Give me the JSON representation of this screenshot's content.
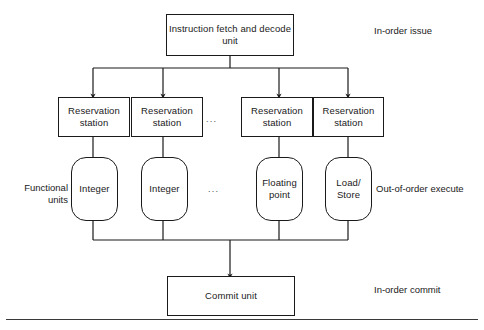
{
  "diagram": {
    "fetch_unit": {
      "label": "Instruction fetch\nand decode unit"
    },
    "commit_unit": {
      "label": "Commit\nunit"
    },
    "reservation_stations": [
      {
        "label": "Reservation\nstation"
      },
      {
        "label": "Reservation\nstation"
      },
      {
        "label": "Reservation\nstation"
      },
      {
        "label": "Reservation\nstation"
      }
    ],
    "functional_units": [
      {
        "label": "Integer"
      },
      {
        "label": "Integer"
      },
      {
        "label": "Floating\npoint"
      },
      {
        "label": "Load/\nStore"
      }
    ],
    "ellipsis": "...",
    "stage_labels": {
      "in_order_issue": "In-order issue",
      "out_of_order_execute": "Out-of-order execute",
      "in_order_commit": "In-order commit"
    },
    "side_labels": {
      "functional_units": "Functional\nunits"
    },
    "colors": {
      "stroke": "#1a1a1a",
      "background": "#ffffff",
      "text": "#1a1a1a",
      "rule": "#3a3a3a"
    }
  }
}
